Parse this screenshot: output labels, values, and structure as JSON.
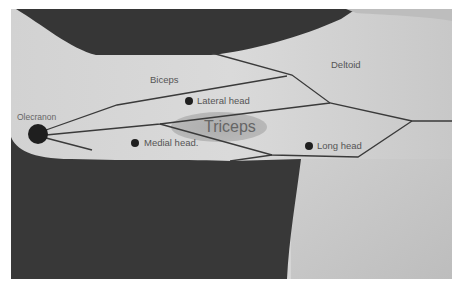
{
  "figure": {
    "labels": {
      "biceps": "Biceps",
      "deltoid": "Deltoid",
      "olecranon": "Olecranon",
      "lateral_head": "Lateral head",
      "medial_head": "Medial head.",
      "long_head": "Long head",
      "triceps": "Triceps"
    },
    "colors": {
      "background_dark": "#3a3a3a",
      "skin_light": "#d6d6d6",
      "skin_mid": "#c4c4c4",
      "lines": "#3a3a3a",
      "dots": "#1f1f1f",
      "triceps_highlight": "#b3b3b3"
    }
  }
}
